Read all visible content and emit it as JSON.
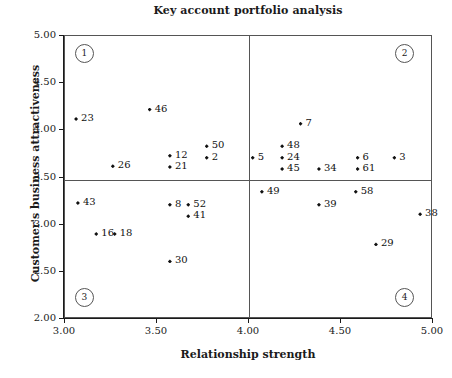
{
  "chart_data": {
    "type": "scatter",
    "title": "Key account portfolio analysis",
    "xlabel": "Relationship strength",
    "ylabel": "Customer's business attractiveness",
    "xlim": [
      3.0,
      5.0
    ],
    "ylim": [
      2.0,
      5.0
    ],
    "xticks": [
      "3.00",
      "3.50",
      "4.00",
      "4.50",
      "5.00"
    ],
    "xtick_values": [
      3.0,
      3.5,
      4.0,
      4.5,
      5.0
    ],
    "yticks": [
      "2.00",
      "2.50",
      "3.00",
      "3.50",
      "4.00",
      "4.50",
      "5.00"
    ],
    "ytick_values": [
      2.0,
      2.5,
      3.0,
      3.5,
      4.0,
      4.5,
      5.0
    ],
    "grid": false,
    "legend": "none",
    "quadrant_divider_x": 4.0,
    "quadrant_divider_y": 3.47,
    "quadrant_badges": [
      {
        "label": "1",
        "x": 3.1,
        "y": 4.82
      },
      {
        "label": "2",
        "x": 4.84,
        "y": 4.82
      },
      {
        "label": "3",
        "x": 3.1,
        "y": 2.24
      },
      {
        "label": "4",
        "x": 4.84,
        "y": 2.24
      }
    ],
    "points": [
      {
        "label": "23",
        "x": 3.06,
        "y": 4.12
      },
      {
        "label": "46",
        "x": 3.46,
        "y": 4.22
      },
      {
        "label": "26",
        "x": 3.26,
        "y": 3.62
      },
      {
        "label": "12",
        "x": 3.57,
        "y": 3.73
      },
      {
        "label": "21",
        "x": 3.57,
        "y": 3.61
      },
      {
        "label": "50",
        "x": 3.77,
        "y": 3.83
      },
      {
        "label": "2",
        "x": 3.77,
        "y": 3.71
      },
      {
        "label": "7",
        "x": 4.28,
        "y": 4.07
      },
      {
        "label": "5",
        "x": 4.02,
        "y": 3.71
      },
      {
        "label": "48",
        "x": 4.18,
        "y": 3.83
      },
      {
        "label": "24",
        "x": 4.18,
        "y": 3.71
      },
      {
        "label": "45",
        "x": 4.18,
        "y": 3.59
      },
      {
        "label": "34",
        "x": 4.38,
        "y": 3.59
      },
      {
        "label": "6",
        "x": 4.59,
        "y": 3.71
      },
      {
        "label": "61",
        "x": 4.59,
        "y": 3.59
      },
      {
        "label": "3",
        "x": 4.79,
        "y": 3.71
      },
      {
        "label": "49",
        "x": 4.07,
        "y": 3.35
      },
      {
        "label": "58",
        "x": 4.58,
        "y": 3.35
      },
      {
        "label": "39",
        "x": 4.38,
        "y": 3.21
      },
      {
        "label": "38",
        "x": 4.93,
        "y": 3.11
      },
      {
        "label": "29",
        "x": 4.69,
        "y": 2.79
      },
      {
        "label": "43",
        "x": 3.07,
        "y": 3.23
      },
      {
        "label": "8",
        "x": 3.57,
        "y": 3.21
      },
      {
        "label": "52",
        "x": 3.67,
        "y": 3.21
      },
      {
        "label": "41",
        "x": 3.67,
        "y": 3.09
      },
      {
        "label": "16",
        "x": 3.17,
        "y": 2.9
      },
      {
        "label": "18",
        "x": 3.27,
        "y": 2.9
      },
      {
        "label": "30",
        "x": 3.57,
        "y": 2.61
      }
    ]
  },
  "colors": {
    "marker": "#111111",
    "axis": "#1a1a1a",
    "frame": "#555555",
    "background": "#ffffff"
  }
}
